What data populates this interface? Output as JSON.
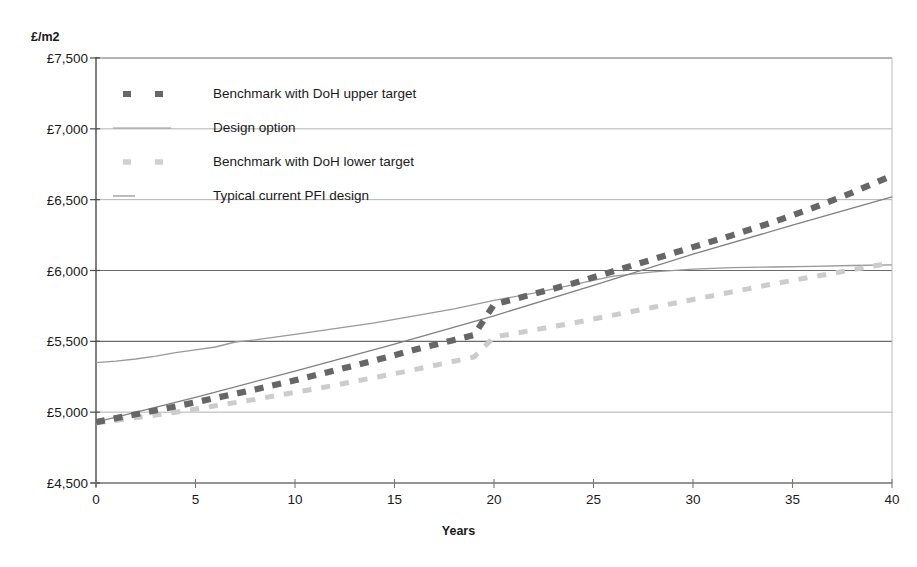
{
  "chart_data": {
    "type": "line",
    "title": "",
    "xlabel": "Years",
    "ylabel": "£/m2",
    "xlim": [
      0,
      40
    ],
    "ylim": [
      4500,
      7500
    ],
    "xticks": [
      "0",
      "5",
      "10",
      "15",
      "20",
      "25",
      "30",
      "35",
      "40"
    ],
    "yticks": [
      "£4,500",
      "£5,000",
      "£5,500",
      "£6,000",
      "£6,500",
      "£7,000",
      "£7,500"
    ],
    "grid": "horizontal",
    "legend_position": "upper-left-inside",
    "series": [
      {
        "name": "Benchmark with DoH upper target",
        "style": "dashed",
        "color": "#666666",
        "x": [
          0,
          2,
          4,
          6,
          8,
          10,
          12,
          14,
          16,
          18,
          19,
          20,
          22,
          24,
          26,
          28,
          30,
          32,
          34,
          36,
          38,
          40
        ],
        "values": [
          4930,
          4985,
          5040,
          5100,
          5160,
          5225,
          5295,
          5365,
          5440,
          5510,
          5545,
          5760,
          5835,
          5910,
          5995,
          6080,
          6165,
          6250,
          6340,
          6440,
          6550,
          6670
        ]
      },
      {
        "name": "Design option",
        "style": "solid",
        "color": "#808080",
        "x": [
          0,
          5,
          10,
          15,
          20,
          25,
          30,
          35,
          40
        ],
        "values": [
          4930,
          5105,
          5290,
          5480,
          5680,
          5895,
          6115,
          6320,
          6520
        ]
      },
      {
        "name": "Benchmark with DoH lower target",
        "style": "dashed",
        "color": "#cccccc",
        "x": [
          0,
          2,
          4,
          6,
          8,
          10,
          12,
          14,
          16,
          18,
          19,
          20,
          22,
          24,
          26,
          28,
          30,
          32,
          34,
          36,
          38,
          40
        ],
        "values": [
          4925,
          4960,
          5000,
          5045,
          5090,
          5140,
          5190,
          5245,
          5300,
          5360,
          5390,
          5530,
          5580,
          5630,
          5685,
          5740,
          5795,
          5850,
          5905,
          5955,
          6005,
          6055
        ]
      },
      {
        "name": "Typical current PFI design",
        "style": "solid",
        "color": "#999999",
        "x": [
          0,
          1,
          2,
          3,
          4,
          5,
          6,
          7,
          8,
          10,
          12,
          14,
          16,
          18,
          20,
          22,
          24,
          26,
          28,
          30,
          32,
          34,
          36,
          38,
          40
        ],
        "values": [
          5350,
          5360,
          5375,
          5395,
          5420,
          5440,
          5460,
          5495,
          5510,
          5550,
          5590,
          5630,
          5680,
          5730,
          5790,
          5840,
          5900,
          5960,
          5990,
          6010,
          6020,
          6025,
          6030,
          6035,
          6040
        ]
      }
    ]
  },
  "legend": {
    "items": [
      {
        "label": "Benchmark with DoH upper target",
        "marker": "dashed-dark"
      },
      {
        "label": "Design option",
        "marker": "solid-light"
      },
      {
        "label": "Benchmark with DoH lower target",
        "marker": "dashed-light"
      },
      {
        "label": "Typical current PFI design",
        "marker": "solid-medium"
      }
    ]
  },
  "colors": {
    "upper_benchmark": "#666666",
    "design_option": "#808080",
    "lower_benchmark": "#cccccc",
    "pfi_design": "#999999",
    "axis": "#555555",
    "grid": "#777777"
  }
}
